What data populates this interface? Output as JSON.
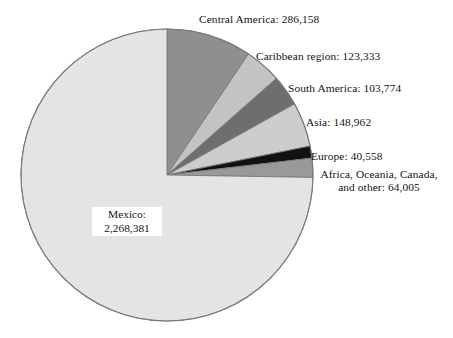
{
  "chart_data": {
    "type": "pie",
    "title": "",
    "subtitle": "",
    "xlabel": "",
    "ylabel": "",
    "legend_position": "none",
    "grid": false,
    "total": 3035171,
    "categories": [
      "Central America",
      "Caribbean region",
      "South America",
      "Asia",
      "Europe",
      "Africa, Oceania, Canada, and other",
      "Mexico"
    ],
    "values": [
      286158,
      123333,
      103774,
      148962,
      40558,
      64005,
      2268381
    ],
    "slices": [
      {
        "name": "Central America",
        "value": 286158,
        "value_text": "286,158",
        "label": "Central America: 286,158",
        "color": "#8f8f8f",
        "percent": 9.43,
        "start_angle": 0,
        "end_angle": 33.94
      },
      {
        "name": "Caribbean region",
        "value": 123333,
        "value_text": "123,333",
        "label": "Caribbean region: 123,333",
        "color": "#c3c3c3",
        "percent": 4.06,
        "start_angle": 33.94,
        "end_angle": 48.57
      },
      {
        "name": "South America",
        "value": 103774,
        "value_text": "103,774",
        "label": "South America: 103,774",
        "color": "#6e6e6e",
        "percent": 3.42,
        "start_angle": 48.57,
        "end_angle": 60.88
      },
      {
        "name": "Asia",
        "value": 148962,
        "value_text": "148,962",
        "label": "Asia: 148,962",
        "color": "#cdcdcd",
        "percent": 4.91,
        "start_angle": 60.88,
        "end_angle": 78.55
      },
      {
        "name": "Europe",
        "value": 40558,
        "value_text": "40,558",
        "label": "Europe: 40,558",
        "color": "#121212",
        "percent": 1.34,
        "start_angle": 78.55,
        "end_angle": 83.36
      },
      {
        "name": "Africa, Oceania, Canada, and other",
        "value": 64005,
        "value_text": "64,005",
        "label": "Africa, Oceania, Canada, and other: 64,005",
        "label_line1": "Africa, Oceania, Canada,",
        "label_line2": "and other: 64,005",
        "color": "#999999",
        "percent": 2.11,
        "start_angle": 83.36,
        "end_angle": 90.95
      },
      {
        "name": "Mexico",
        "value": 2268381,
        "value_text": "2,268,381",
        "label": "Mexico: 2,268,381",
        "label_line1": "Mexico:",
        "label_line2": "2,268,381",
        "color": "#e4e4e4",
        "percent": 74.74,
        "start_angle": 90.95,
        "end_angle": 360
      }
    ],
    "geometry": {
      "center_x": 167,
      "center_y": 175,
      "radius": 146,
      "outline_color": "#7a7a7a",
      "background": "#ffffff"
    }
  }
}
